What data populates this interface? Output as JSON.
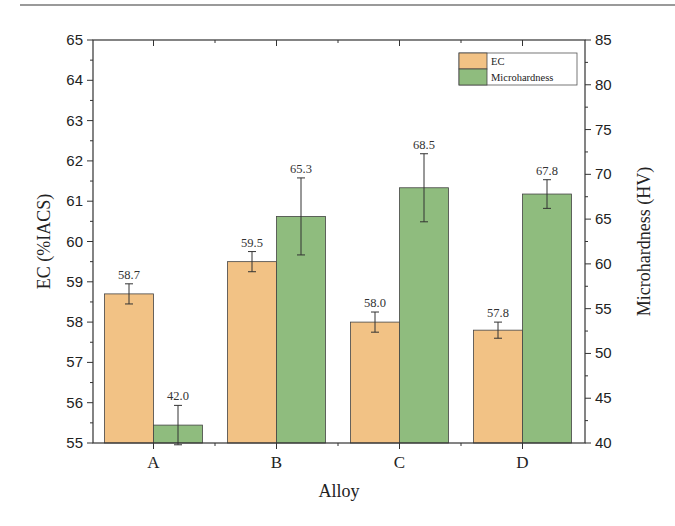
{
  "chart_data": {
    "type": "bar",
    "title": "",
    "xlabel": "Alloy",
    "ylabel": "EC (%IACS)",
    "y2label": "Microhardness (HV)",
    "categories": [
      "A",
      "B",
      "C",
      "D"
    ],
    "ylim": [
      55,
      65
    ],
    "y2lim": [
      40,
      85
    ],
    "yticks": [
      55,
      56,
      57,
      58,
      59,
      60,
      61,
      62,
      63,
      64,
      65
    ],
    "y2ticks": [
      40,
      45,
      50,
      55,
      60,
      65,
      70,
      75,
      80,
      85
    ],
    "grid": false,
    "legend_position": "top-right",
    "series": [
      {
        "name": "EC",
        "axis": "left",
        "color": "#f2c285",
        "values": [
          58.7,
          59.5,
          58.0,
          57.8
        ],
        "errors": [
          0.25,
          0.25,
          0.25,
          0.2
        ],
        "labels": [
          "58.7",
          "59.5",
          "58.0",
          "57.8"
        ]
      },
      {
        "name": "Microhardness",
        "axis": "right",
        "color": "#8fbc7e",
        "values": [
          42.0,
          65.3,
          68.5,
          67.8
        ],
        "errors": [
          2.2,
          4.3,
          3.8,
          1.6
        ],
        "labels": [
          "42.0",
          "65.3",
          "68.5",
          "67.8"
        ]
      }
    ]
  }
}
